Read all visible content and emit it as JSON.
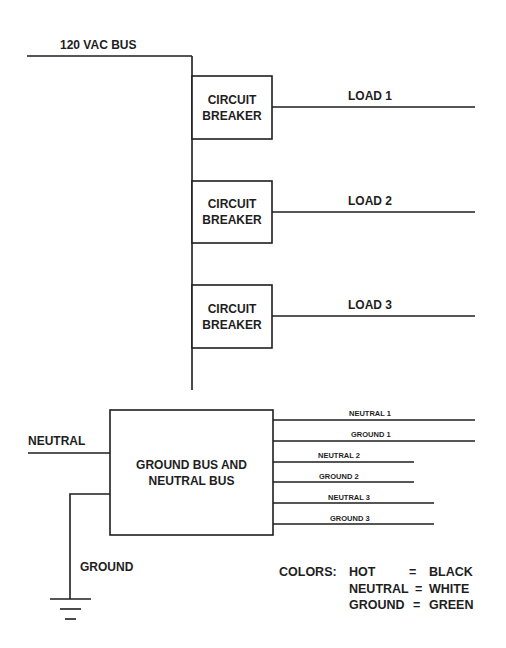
{
  "diagram": {
    "bus_label": "120 VAC BUS",
    "breakers": [
      {
        "line1": "CIRCUIT",
        "line2": "BREAKER",
        "load": "LOAD 1"
      },
      {
        "line1": "CIRCUIT",
        "line2": "BREAKER",
        "load": "LOAD 2"
      },
      {
        "line1": "CIRCUIT",
        "line2": "BREAKER",
        "load": "LOAD 3"
      }
    ],
    "bus_box": {
      "line1": "GROUND BUS AND",
      "line2": "NEUTRAL BUS"
    },
    "neutral_label": "NEUTRAL",
    "ground_label": "GROUND",
    "outputs": [
      "NEUTRAL 1",
      "GROUND 1",
      "NEUTRAL 2",
      "GROUND 2",
      "NEUTRAL 3",
      "GROUND 3"
    ],
    "legend": {
      "title": "COLORS:",
      "rows": [
        {
          "wire": "HOT",
          "eq": "=",
          "color": "BLACK"
        },
        {
          "wire": "NEUTRAL",
          "eq": "=",
          "color": "WHITE"
        },
        {
          "wire": "GROUND",
          "eq": "=",
          "color": "GREEN"
        }
      ]
    },
    "line_color": "#1e1e1e"
  }
}
